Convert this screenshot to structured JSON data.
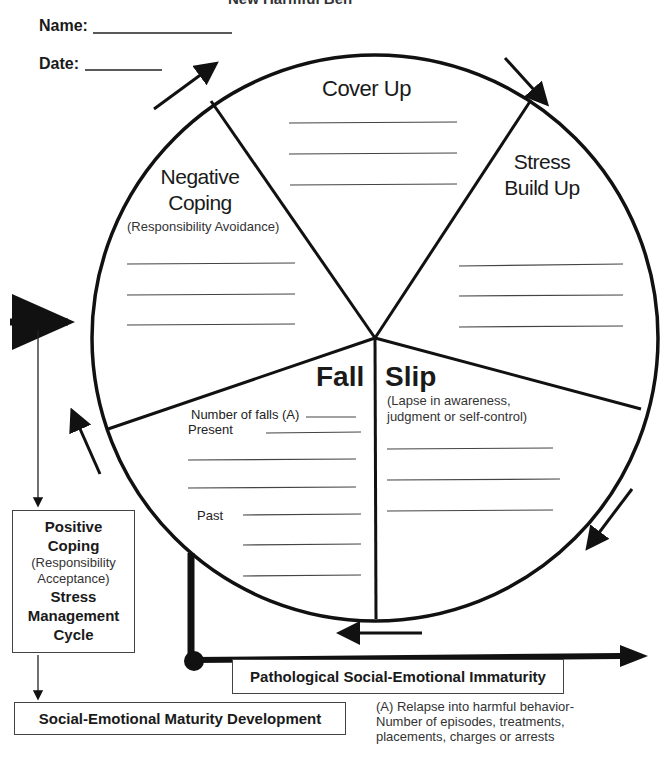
{
  "header": {
    "title_clipped": "New Harmful Beh",
    "name_label": "Name:",
    "date_label": "Date:"
  },
  "cycle": {
    "segments": [
      {
        "id": "cover-up",
        "title": "Cover Up",
        "blank_lines": 3
      },
      {
        "id": "stress-build-up",
        "title_line1": "Stress",
        "title_line2": "Build Up",
        "blank_lines": 3
      },
      {
        "id": "slip",
        "title": "Slip",
        "subtitle_line1": "(Lapse in awareness,",
        "subtitle_line2": "judgment or self-control)",
        "blank_lines": 3
      },
      {
        "id": "fall",
        "title": "Fall",
        "number_of_falls_label": "Number of falls (A)",
        "present_label": "Present",
        "past_label": "Past",
        "blank_lines": 7
      },
      {
        "id": "negative-coping",
        "title_line1": "Negative",
        "title_line2": "Coping",
        "subtitle": "(Responsibility Avoidance)",
        "blank_lines": 3
      }
    ],
    "direction": "clockwise"
  },
  "positive_box": {
    "line1": "Positive",
    "line2": "Coping",
    "line3": "(Responsibility",
    "line4": "Acceptance)",
    "line5": "Stress",
    "line6": "Management",
    "line7": "Cycle"
  },
  "maturity_box": {
    "label": "Social-Emotional Maturity Development"
  },
  "pathology_box": {
    "label": "Pathological Social-Emotional Immaturity"
  },
  "footnote": {
    "text": "(A) Relapse into harmful behavior- Number of episodes, treatments, placements, charges or arrests"
  }
}
